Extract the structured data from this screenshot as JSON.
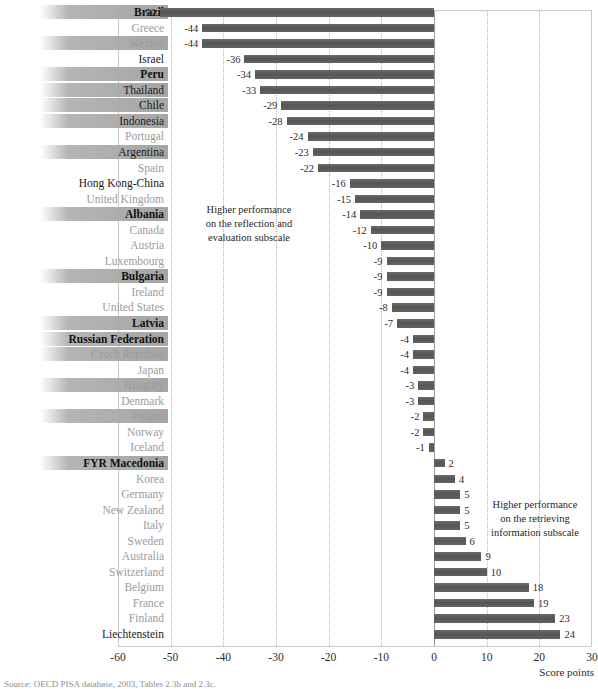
{
  "chart_data": {
    "type": "bar",
    "orientation": "horizontal",
    "title": "",
    "xlabel": "Score points",
    "ylabel": "",
    "xlim": [
      -60,
      30
    ],
    "xticks": [
      -60,
      -50,
      -40,
      -30,
      -20,
      -10,
      0,
      10,
      20,
      30
    ],
    "grid": true,
    "legend": "none",
    "bar_color": "#5d5d5d",
    "categories": [
      "Brazil",
      "Greece",
      "Mexico",
      "Israel",
      "Peru",
      "Thailand",
      "Chile",
      "Indonesia",
      "Portugal",
      "Argentina",
      "Spain",
      "Hong Kong-China",
      "United Kingdom",
      "Albania",
      "Canada",
      "Austria",
      "Luxembourg",
      "Bulgaria",
      "Ireland",
      "United States",
      "Latvia",
      "Russian Federation",
      "Czech Republic",
      "Japan",
      "Hungary",
      "Denmark",
      "Poland",
      "Norway",
      "Iceland",
      "FYR Macedonia",
      "Korea",
      "Germany",
      "New Zealand",
      "Italy",
      "Sweden",
      "Australia",
      "Switzerland",
      "Belgium",
      "France",
      "Finland",
      "Liechtenstein"
    ],
    "values": [
      -52,
      -44,
      -44,
      -36,
      -34,
      -33,
      -29,
      -28,
      -24,
      -23,
      -22,
      -16,
      -15,
      -14,
      -12,
      -10,
      -9,
      -9,
      -9,
      -8,
      -7,
      -4,
      -4,
      -4,
      -3,
      -3,
      -2,
      -2,
      -1,
      2,
      4,
      5,
      5,
      5,
      6,
      9,
      10,
      18,
      19,
      23,
      24
    ],
    "highlighted": [
      "Brazil",
      "Mexico",
      "Peru",
      "Thailand",
      "Chile",
      "Indonesia",
      "Argentina",
      "Albania",
      "Bulgaria",
      "Latvia",
      "Russian Federation",
      "Czech Republic",
      "Hungary",
      "Poland",
      "FYR Macedonia"
    ],
    "label_styles": {
      "Brazil": "bold",
      "Greece": "light",
      "Mexico": "light",
      "Israel": "dark",
      "Peru": "bold",
      "Thailand": "dark",
      "Chile": "dark",
      "Indonesia": "dark",
      "Portugal": "light",
      "Argentina": "dark",
      "Spain": "light",
      "Hong Kong-China": "dark",
      "United Kingdom": "light",
      "Albania": "bold",
      "Canada": "light",
      "Austria": "light",
      "Luxembourg": "light",
      "Bulgaria": "bold",
      "Ireland": "light",
      "United States": "light",
      "Latvia": "bold",
      "Russian Federation": "bold",
      "Czech Republic": "light",
      "Japan": "light",
      "Hungary": "light",
      "Denmark": "light",
      "Poland": "light",
      "Norway": "light",
      "Iceland": "light",
      "FYR Macedonia": "bold",
      "Korea": "light",
      "Germany": "light",
      "New Zealand": "light",
      "Italy": "light",
      "Sweden": "light",
      "Australia": "light",
      "Switzerland": "light",
      "Belgium": "light",
      "France": "light",
      "Finland": "light",
      "Liechtenstein": "dark"
    },
    "annotations": [
      {
        "id": "left",
        "text": "Higher performance\non the reflection and\nevaluation subscale"
      },
      {
        "id": "right",
        "text": "Higher performance\non the retrieving\ninformation subscale"
      }
    ]
  },
  "axis": {
    "title": "Score points"
  },
  "source": {
    "note": "Source: OECD PISA database, 2003, Tables 2.3b and 2.3c."
  }
}
